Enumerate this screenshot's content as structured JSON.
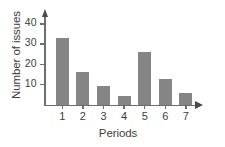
{
  "chart_data": {
    "type": "bar",
    "title": "",
    "xlabel": "Periods",
    "ylabel": "Number of issues",
    "categories": [
      "1",
      "2",
      "3",
      "4",
      "5",
      "6",
      "7"
    ],
    "values": [
      33,
      16,
      9,
      4,
      26,
      12.5,
      5.5
    ],
    "ylim": [
      0,
      44
    ],
    "yticks": [
      10,
      20,
      30,
      40
    ],
    "ytick_labels": [
      "10",
      "20",
      "30",
      "40"
    ],
    "xtick_labels": [
      "1",
      "2",
      "3",
      "4",
      "5",
      "6",
      "7"
    ],
    "grid": false,
    "legend": null,
    "bar_color": "#858585",
    "axis_color": "#6e6e6e",
    "background": "#ffffff"
  }
}
